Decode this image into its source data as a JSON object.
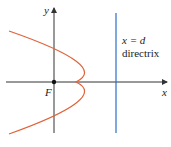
{
  "diagram": {
    "type": "parabola-focus-directrix",
    "labels": {
      "y_axis": "y",
      "x_axis": "x",
      "focus": "F",
      "directrix_eq": "x = d",
      "directrix_name": "directrix"
    },
    "colors": {
      "parabola": "#e0623a",
      "directrix": "#2a6fc9",
      "axes": "#333333"
    }
  }
}
